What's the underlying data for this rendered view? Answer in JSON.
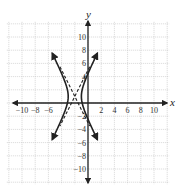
{
  "chart_data": {
    "type": "line",
    "title": "",
    "xlabel": "x",
    "ylabel": "y",
    "xlim": [
      -12,
      12
    ],
    "ylim": [
      -12,
      12
    ],
    "grid": true,
    "grid_step": 2,
    "x_ticks": [
      -10,
      -8,
      -6,
      2,
      4,
      6,
      8,
      10
    ],
    "x_tick_labels": [
      "−10",
      "−8",
      "−6",
      "2",
      "4",
      "6",
      "8",
      "10"
    ],
    "y_ticks": [
      10,
      8,
      6,
      4,
      -2,
      -4,
      -6,
      -8,
      -10
    ],
    "y_tick_labels": [
      "10",
      "8",
      "6",
      "4",
      "−2",
      "−4",
      "−6",
      "−8",
      "−10"
    ],
    "series": [
      {
        "name": "hyperbola",
        "equation": "(x+2)^2 - (y-1)^2/4 = 1",
        "center": [
          -2,
          1
        ],
        "vertices": [
          [
            -3,
            1
          ],
          [
            -1,
            1
          ]
        ],
        "style": "solid",
        "arrows": true
      },
      {
        "name": "asymptote 1",
        "equation": "y - 1 = 2(x + 2)",
        "style": "dashed"
      },
      {
        "name": "asymptote 2",
        "equation": "y - 1 = -2(x + 2)",
        "style": "dashed"
      }
    ]
  }
}
